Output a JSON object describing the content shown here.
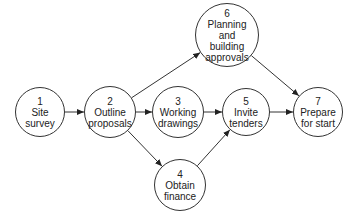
{
  "nodes": [
    {
      "id": "1",
      "number": "1",
      "line1": "Site",
      "line2": "survey",
      "line3": "",
      "line4": "",
      "cx": 40,
      "cy": 112,
      "r": 25
    },
    {
      "id": "2",
      "number": "2",
      "line1": "Outline",
      "line2": "proposals",
      "line3": "",
      "line4": "",
      "cx": 110,
      "cy": 112,
      "r": 26
    },
    {
      "id": "3",
      "number": "3",
      "line1": "Working",
      "line2": "drawings",
      "line3": "",
      "line4": "",
      "cx": 178,
      "cy": 112,
      "r": 26
    },
    {
      "id": "4",
      "number": "4",
      "line1": "Obtain",
      "line2": "finance",
      "line3": "",
      "line4": "",
      "cx": 180,
      "cy": 185,
      "r": 26
    },
    {
      "id": "5",
      "number": "5",
      "line1": "Invite",
      "line2": "tenders",
      "line3": "",
      "line4": "",
      "cx": 246,
      "cy": 112,
      "r": 24
    },
    {
      "id": "6",
      "number": "6",
      "line1": "Planning",
      "line2": "and",
      "line3": "building",
      "line4": "approvals",
      "cx": 227,
      "cy": 35,
      "r": 32
    },
    {
      "id": "7",
      "number": "7",
      "line1": "Prepare",
      "line2": "for start",
      "line3": "",
      "line4": "",
      "cx": 318,
      "cy": 112,
      "r": 25
    }
  ],
  "edges": [
    {
      "from": "1",
      "to": "2"
    },
    {
      "from": "2",
      "to": "3"
    },
    {
      "from": "2",
      "to": "6"
    },
    {
      "from": "2",
      "to": "4"
    },
    {
      "from": "3",
      "to": "5"
    },
    {
      "from": "4",
      "to": "5"
    },
    {
      "from": "5",
      "to": "7"
    },
    {
      "from": "6",
      "to": "7"
    }
  ]
}
